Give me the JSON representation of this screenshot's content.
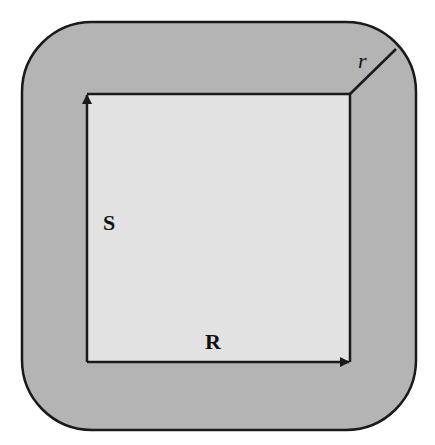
{
  "diagram": {
    "labels": {
      "vertical_side": "S",
      "horizontal_side": "R",
      "corner_radius": "r"
    },
    "colors": {
      "outer_region": "#b4b4b4",
      "inner_square": "#e2e2e2",
      "stroke": "#1a1a1a",
      "background": "#ffffff"
    },
    "shapes": {
      "outer_rounded_rect": {
        "x": 22,
        "y": 22,
        "width": 394,
        "height": 408,
        "corner_radius": 70
      },
      "inner_square": {
        "x": 87,
        "y": 94,
        "width": 263,
        "height": 268
      },
      "radius_line": {
        "x1": 350,
        "y1": 94,
        "x2": 396,
        "y2": 49
      }
    },
    "arrows": [
      {
        "name": "S-arrow",
        "direction": "up",
        "from": [
          87,
          362
        ],
        "to": [
          87,
          94
        ]
      },
      {
        "name": "R-arrow",
        "direction": "right",
        "from": [
          87,
          362
        ],
        "to": [
          350,
          362
        ]
      }
    ]
  }
}
